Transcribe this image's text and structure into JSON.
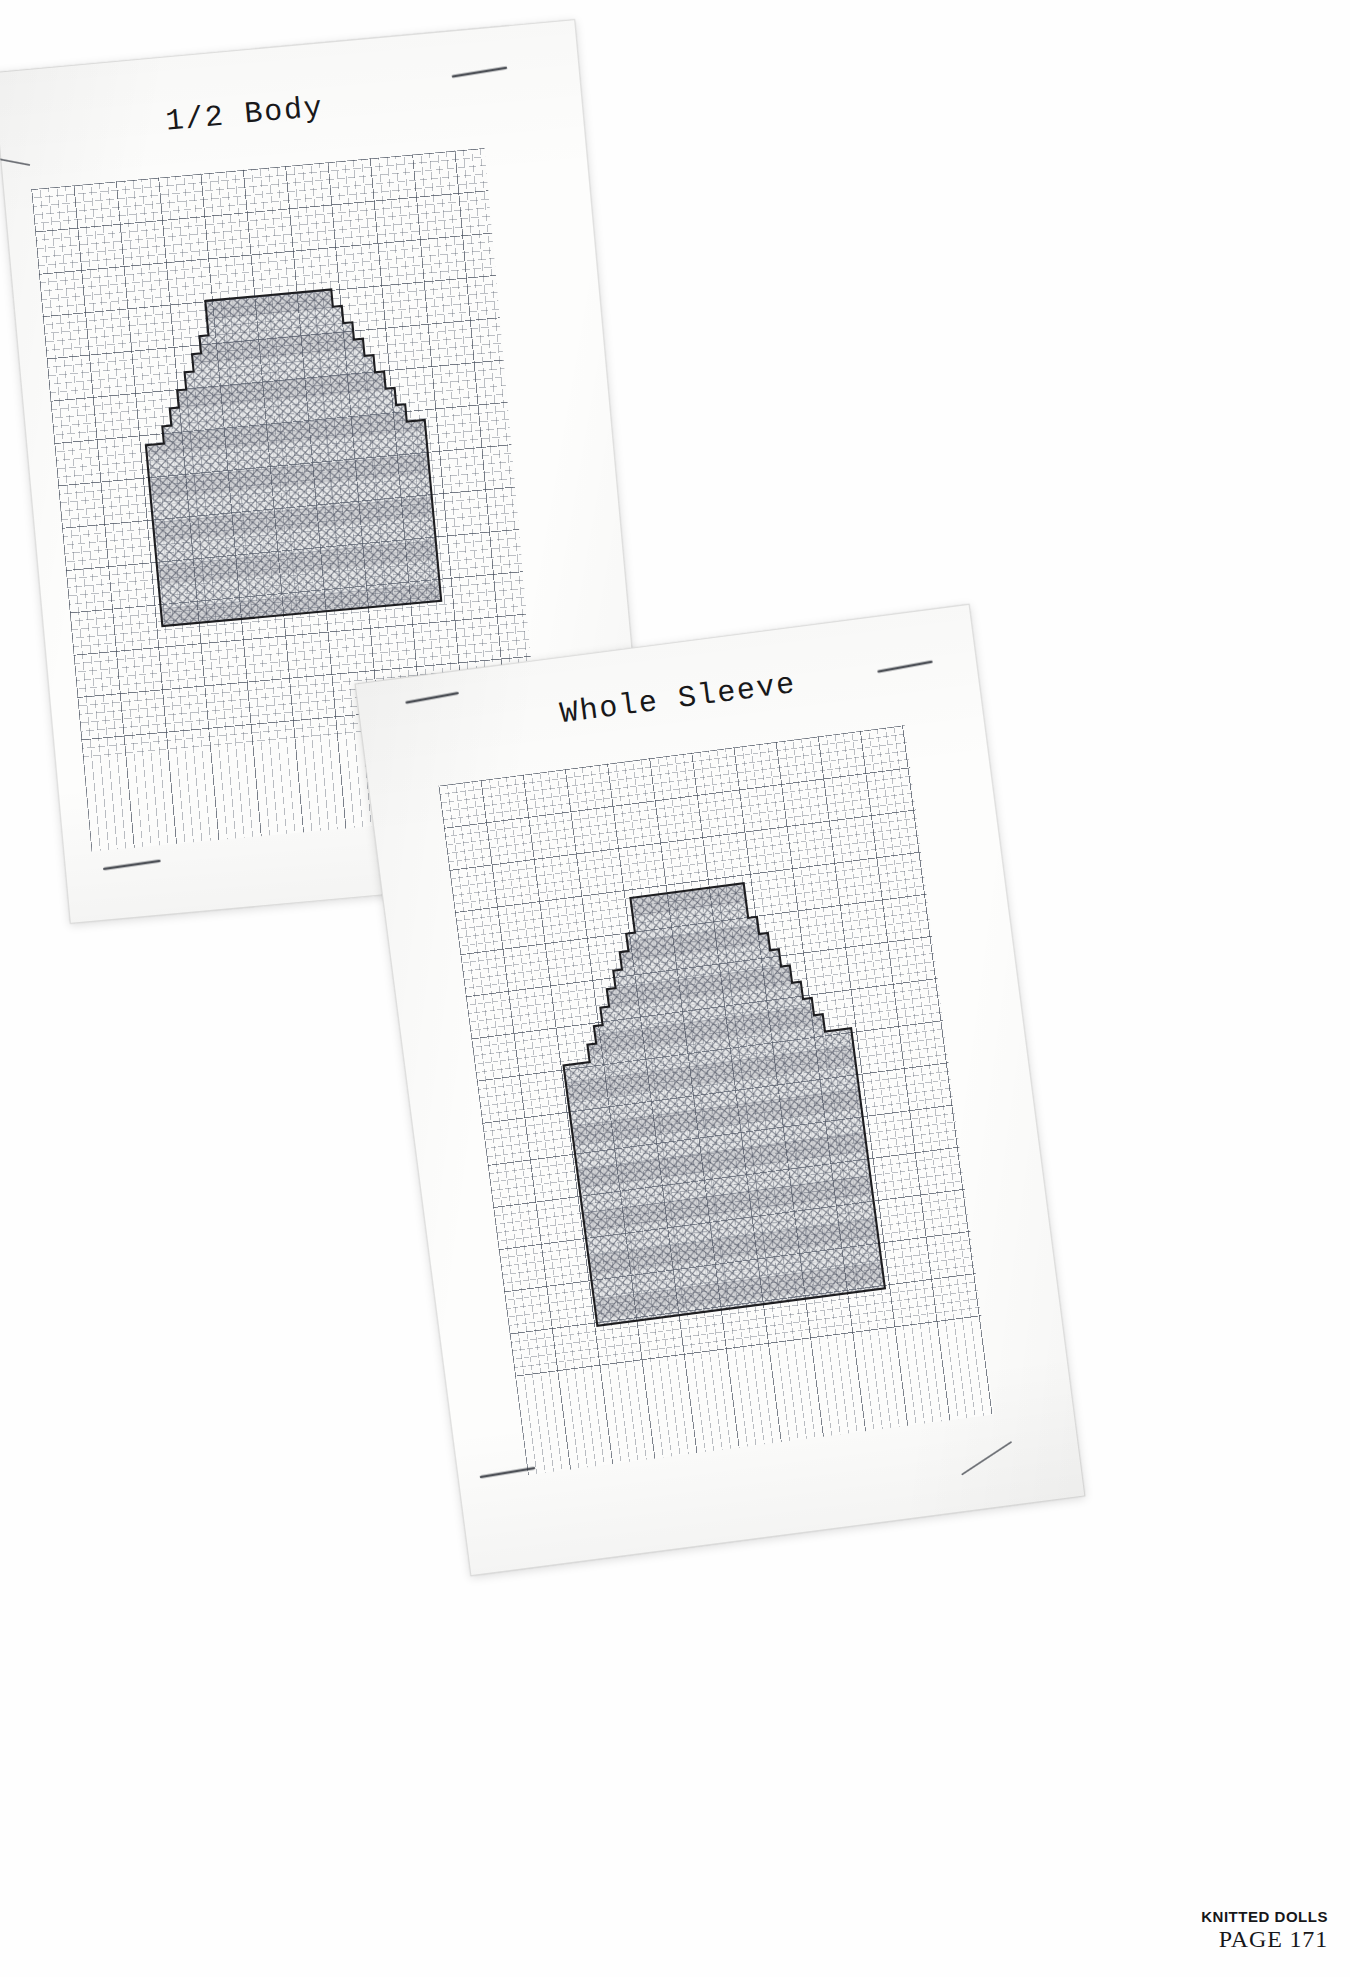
{
  "page": {
    "background_color": "#ffffff",
    "footer": {
      "book_title": "KNITTED DOLLS",
      "page_label": "PAGE 171"
    }
  },
  "sheets": [
    {
      "id": "sheet-half-body",
      "title": "1/2 Body",
      "paper_color": "#fdfdfc",
      "rotation_deg": -5.2,
      "staples": 3
    },
    {
      "id": "sheet-whole-sleeve",
      "title": "Whole Sleeve",
      "paper_color": "#fdfdfc",
      "rotation_deg": -7.4,
      "staples": 3
    }
  ],
  "chart_data": [
    {
      "type": "heatmap",
      "title": "1/2 Body",
      "subtitle": "",
      "xlabel": "stitches",
      "ylabel": "rows",
      "grid": true,
      "legend": "none",
      "notes": "Knitting chart on graph paper. Filled cells are marked with an X (cross-stitch/crosshatch). Outline is a stepped shoulder-shaping silhouette.",
      "cell_size_px": 8.5,
      "major_gridline_every": 5,
      "fill_symbol": "X",
      "outline_color": "#1d1d20",
      "fill_color": "#5c6270",
      "columns": 31,
      "rows": 37,
      "row_widths": [
        14,
        14,
        14,
        14,
        14,
        16,
        16,
        18,
        18,
        20,
        20,
        22,
        22,
        24,
        24,
        26,
        26,
        28,
        28,
        29,
        29,
        31,
        31,
        31,
        31,
        31,
        31,
        31,
        31,
        31,
        31,
        31,
        31,
        31,
        31,
        31,
        31
      ],
      "shape_outline_cells": [
        [
          8,
          0
        ],
        [
          22,
          0
        ],
        [
          22,
          2
        ],
        [
          23,
          2
        ],
        [
          23,
          4
        ],
        [
          24,
          4
        ],
        [
          24,
          6
        ],
        [
          25,
          6
        ],
        [
          25,
          8
        ],
        [
          26,
          8
        ],
        [
          26,
          10
        ],
        [
          27,
          10
        ],
        [
          27,
          12
        ],
        [
          28,
          12
        ],
        [
          28,
          14
        ],
        [
          29,
          14
        ],
        [
          29,
          16
        ],
        [
          31,
          16
        ],
        [
          31,
          37
        ],
        [
          0,
          37
        ],
        [
          0,
          16
        ],
        [
          2,
          16
        ],
        [
          2,
          14
        ],
        [
          3,
          14
        ],
        [
          3,
          12
        ],
        [
          4,
          12
        ],
        [
          4,
          10
        ],
        [
          5,
          10
        ],
        [
          5,
          8
        ],
        [
          6,
          8
        ],
        [
          6,
          6
        ],
        [
          7,
          6
        ],
        [
          7,
          4
        ],
        [
          8,
          4
        ]
      ]
    },
    {
      "type": "heatmap",
      "title": "Whole Sleeve",
      "subtitle": "",
      "xlabel": "stitches",
      "ylabel": "rows",
      "grid": true,
      "legend": "none",
      "notes": "Knitting chart on graph paper. Filled cells marked with an X. Outline is a stepped sleeve-cap silhouette above a straight sleeve body.",
      "cell_size_px": 8.5,
      "major_gridline_every": 5,
      "fill_symbol": "X",
      "outline_color": "#1d1d20",
      "fill_color": "#5c6270",
      "columns": 33,
      "rows": 48,
      "row_widths": [
        13,
        13,
        13,
        13,
        17,
        17,
        19,
        19,
        21,
        21,
        23,
        23,
        25,
        25,
        27,
        27,
        29,
        29,
        31,
        31,
        33,
        33,
        33,
        33,
        33,
        33,
        33,
        33,
        33,
        33,
        33,
        33,
        33,
        33,
        33,
        33,
        33,
        33,
        33,
        33,
        33,
        33,
        33,
        33,
        33,
        33,
        33,
        33
      ],
      "shape_outline_cells": [
        [
          10,
          0
        ],
        [
          23,
          0
        ],
        [
          23,
          4
        ],
        [
          24,
          4
        ],
        [
          24,
          6
        ],
        [
          25,
          6
        ],
        [
          25,
          8
        ],
        [
          26,
          8
        ],
        [
          26,
          10
        ],
        [
          27,
          10
        ],
        [
          27,
          12
        ],
        [
          28,
          12
        ],
        [
          28,
          14
        ],
        [
          29,
          14
        ],
        [
          29,
          16
        ],
        [
          30,
          16
        ],
        [
          30,
          18
        ],
        [
          33,
          18
        ],
        [
          33,
          48
        ],
        [
          0,
          48
        ],
        [
          0,
          18
        ],
        [
          3,
          18
        ],
        [
          3,
          16
        ],
        [
          4,
          16
        ],
        [
          4,
          14
        ],
        [
          5,
          14
        ],
        [
          5,
          12
        ],
        [
          6,
          12
        ],
        [
          6,
          10
        ],
        [
          7,
          10
        ],
        [
          7,
          8
        ],
        [
          8,
          8
        ],
        [
          8,
          6
        ],
        [
          9,
          6
        ],
        [
          9,
          4
        ],
        [
          10,
          4
        ]
      ]
    }
  ]
}
